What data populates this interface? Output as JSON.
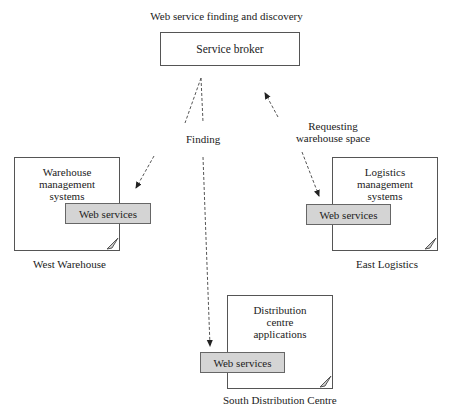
{
  "title": "Web service finding and discovery",
  "broker": {
    "label": "Service broker"
  },
  "nodes": {
    "west": {
      "system": "Warehouse management systems",
      "system_lines": [
        "Warehouse",
        "management",
        "systems"
      ],
      "service": "Web services",
      "caption": "West Warehouse"
    },
    "east": {
      "system": "Logistics management systems",
      "system_lines": [
        "Logistics",
        "management",
        "systems"
      ],
      "service": "Web services",
      "caption": "East Logistics"
    },
    "south": {
      "system": "Distribution centre applications",
      "system_lines": [
        "Distribution",
        "centre",
        "applications"
      ],
      "service": "Web services",
      "caption": "South Distribution Centre"
    }
  },
  "edges": {
    "finding": {
      "label": "Finding",
      "style": "dashed",
      "from": "Service broker",
      "to": [
        "West Warehouse",
        "South Distribution Centre"
      ]
    },
    "requesting": {
      "label_lines": [
        "Requesting",
        "warehouse space"
      ],
      "label": "Requesting warehouse space",
      "style": "dashed-bidirectional",
      "from": "East Logistics",
      "to": "Service broker"
    }
  },
  "colors": {
    "line": "#555555",
    "service_fill": "#d4d4d4",
    "background": "#ffffff"
  }
}
